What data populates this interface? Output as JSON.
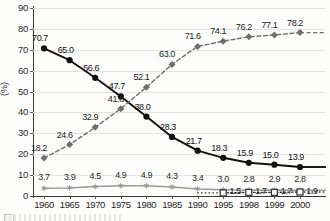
{
  "chart_data": {
    "type": "line",
    "title": "",
    "subtitle": "",
    "xlabel": "",
    "ylabel": "(%)",
    "ylim": [
      0,
      90
    ],
    "ytick_step": 10,
    "yticks": [
      0,
      10,
      20,
      30,
      40,
      50,
      60,
      70,
      80,
      90
    ],
    "grid": true,
    "legend_position": "bottom-left",
    "categories": [
      "1960",
      "1965",
      "1970",
      "1975",
      "1980",
      "1985",
      "1990",
      "1995",
      "1998",
      "1999",
      "2000"
    ],
    "series": [
      {
        "name": "series-black-circle",
        "marker": "filled-circle",
        "line": "solid",
        "color": "#111111",
        "values": [
          70.7,
          65.0,
          56.6,
          47.7,
          38.0,
          28.3,
          21.7,
          18.3,
          15.9,
          15.0,
          13.9
        ],
        "labels": [
          "70.7",
          "65.0",
          "56.6",
          "47.7",
          "38.0",
          "28.3",
          "21.7",
          "18.3",
          "15.9",
          "15.0",
          "13.9"
        ]
      },
      {
        "name": "series-gray-diamond",
        "marker": "filled-diamond",
        "line": "dashed",
        "color": "#6e6e6e",
        "values": [
          18.2,
          24.6,
          32.9,
          41.8,
          52.1,
          63.0,
          71.6,
          74.1,
          76.2,
          77.1,
          78.2
        ],
        "labels": [
          "18.2",
          "24.6",
          "32.9",
          "41.8",
          "52.1",
          "63.0",
          "71.6",
          "74.1",
          "76.2",
          "77.1",
          "78.2"
        ]
      },
      {
        "name": "series-gray-star",
        "marker": "star",
        "line": "solid",
        "color": "#9a9a9a",
        "values": [
          3.7,
          3.9,
          4.5,
          4.9,
          4.9,
          4.3,
          3.4,
          3.0,
          2.8,
          2.9,
          2.8
        ],
        "labels": [
          "3.7",
          "3.9",
          "4.5",
          "4.9",
          "4.9",
          "4.3",
          "3.4",
          "3.0",
          "2.8",
          "2.9",
          "2.8"
        ]
      },
      {
        "name": "series-open-square",
        "marker": "open-square",
        "line": "dotted",
        "color": "#3a3a3a",
        "values": [
          null,
          null,
          null,
          null,
          null,
          null,
          null,
          1.5,
          1.7,
          1.7,
          1.9
        ],
        "labels": [
          "",
          "",
          "",
          "",
          "",
          "",
          "",
          "1.5",
          "1.7",
          "1.7",
          "1.9"
        ]
      }
    ]
  }
}
